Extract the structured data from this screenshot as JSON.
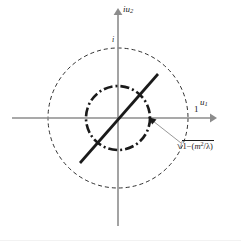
{
  "figure": {
    "kind": "complex-plane-diagram",
    "background_color": "#ffffff",
    "axes": {
      "origin": [
        118,
        118
      ],
      "x_axis": {
        "label": "u₁",
        "label_base": "u",
        "label_sub": "1",
        "start": [
          12,
          118
        ],
        "end": [
          214,
          118
        ],
        "color": "#8c8c8c",
        "arrow": "right"
      },
      "y_axis": {
        "label": "iu₂",
        "label_base": "iu",
        "label_sub": "2",
        "start": [
          118,
          226
        ],
        "end": [
          118,
          10
        ],
        "color": "#8c8c8c",
        "arrow": "up"
      }
    },
    "ticks": [
      {
        "name": "unit-real",
        "label": "1",
        "value": 1,
        "position": [
          188,
          118
        ]
      },
      {
        "name": "unit-imaginary",
        "label": "i",
        "value": "i",
        "position": [
          118,
          48
        ]
      }
    ],
    "circles": [
      {
        "name": "unit-circle",
        "radius_px": 70,
        "radius_value": 1,
        "center": [
          118,
          118
        ],
        "stroke": "#1a1a1a",
        "style": "dashed",
        "dash_pattern": "4 3",
        "stroke_width": 0.9
      },
      {
        "name": "inner-circle",
        "radius_px": 32,
        "radius_label": "√(1 − (m²/λ))",
        "center": [
          118,
          118
        ],
        "stroke": "#1a1a1a",
        "style": "dash-dot",
        "dash_pattern": "9 3 2 3",
        "stroke_width": 2.6
      }
    ],
    "diagonal_line": {
      "name": "diagonal-segment",
      "from": [
        80,
        163
      ],
      "to": [
        158,
        74
      ],
      "stroke": "#1a1a1a",
      "stroke_width": 2.7
    },
    "annotation": {
      "name": "inner-radius-annotation",
      "text": "√1 − (m²/λ)",
      "radicand_lead": "1",
      "minus": "−",
      "radicand_tail_open": "(",
      "radicand_base": "m",
      "radicand_exp": "2",
      "radicand_div": "/",
      "radicand_lambda": "λ",
      "radicand_tail_close": ")",
      "arrow_from": [
        181,
        143
      ],
      "arrow_to": [
        150,
        119
      ],
      "arrow_color": "#8c8c8c"
    },
    "colors": {
      "axis": "#8c8c8c",
      "curve": "#1a1a1a",
      "text": "#1a1a1a",
      "annotation_arrow": "#8c8c8c"
    }
  }
}
